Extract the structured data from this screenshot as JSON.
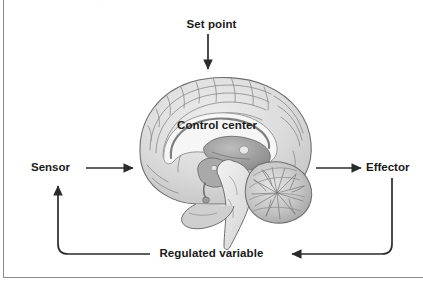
{
  "figure": {
    "background_color": "#ffffff",
    "frame_color": "#8a8a8a",
    "line_color": "#2b2b2b",
    "text_color": "#1a1a1a",
    "top_artifact_text": "·  ·   ·  ·    ·   ·"
  },
  "labels": {
    "set_point": "Set point",
    "control_center": "Control center",
    "sensor": "Sensor",
    "effector": "Effector",
    "regulated_variable": "Regulated variable"
  },
  "illustration": {
    "name": "midsagittal-brain",
    "description": "Grayscale midsagittal section of the human brain showing cerebral cortex, corpus callosum, thalamus, brainstem and cerebellum",
    "palette": {
      "cortex_fill": "#d8d8d8",
      "cortex_outline": "#6f6f6f",
      "white_matter": "#f4f4f4",
      "deep_structure": "#9a9a9a",
      "brainstem": "#e4e4e4",
      "cerebellum": "#bdbdbd",
      "shadow": "#7c7c7c"
    }
  },
  "flow": {
    "arrows": [
      {
        "name": "set-point-to-control-center",
        "from": "Set point",
        "to": "Control center",
        "direction": "down"
      },
      {
        "name": "sensor-to-control-center",
        "from": "Sensor",
        "to": "Control center",
        "direction": "right"
      },
      {
        "name": "control-center-to-effector",
        "from": "Control center",
        "to": "Effector",
        "direction": "right"
      },
      {
        "name": "effector-to-regulated-variable",
        "from": "Effector",
        "to": "Regulated variable",
        "direction": "down-left"
      },
      {
        "name": "regulated-variable-to-sensor",
        "from": "Regulated variable",
        "to": "Sensor",
        "direction": "left-up"
      }
    ]
  }
}
